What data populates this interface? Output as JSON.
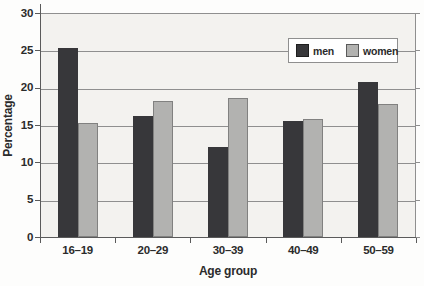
{
  "chart_data": {
    "type": "bar",
    "title": "",
    "xlabel": "Age group",
    "ylabel": "Percentage",
    "categories": [
      "16–19",
      "20–29",
      "30–39",
      "40–49",
      "50–59"
    ],
    "series": [
      {
        "name": "men",
        "color": "#37373a",
        "values": [
          25.3,
          16.2,
          12.0,
          15.5,
          20.8
        ]
      },
      {
        "name": "women",
        "color": "#b2b2b0",
        "values": [
          15.3,
          18.2,
          18.6,
          15.8,
          17.8
        ]
      }
    ],
    "ylim": [
      0,
      30
    ],
    "yticks": [
      0,
      5,
      10,
      15,
      20,
      25,
      30
    ],
    "grid": true,
    "legend_position": "top-right",
    "colors": {
      "plot_background": "#f3f2ef",
      "gridline": "#8f8f8f",
      "axis": "#5a5a5a",
      "text": "#2b2b2b",
      "legend_background": "#ffffff"
    }
  }
}
